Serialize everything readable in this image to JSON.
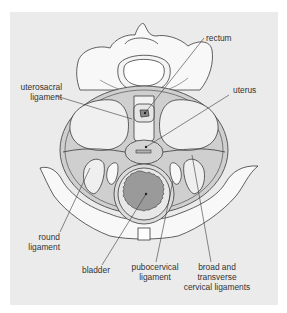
{
  "diagram": {
    "colors": {
      "background_panel": "#ebebeb",
      "bone": "#f7f7f7",
      "ligament_band": "#c9c9c9",
      "organ_fill": "#d6d6d6",
      "bladder_inner": "#9a9a9a",
      "rectum_inner": "#8a8a8a",
      "outline": "#3a3a3a"
    },
    "labels": {
      "rectum": "rectum",
      "uterosacral_1": "uterosacral",
      "uterosacral_2": "ligament",
      "uterus": "uterus",
      "round_1": "round",
      "round_2": "ligament",
      "bladder": "bladder",
      "pubocervical_1": "pubocervical",
      "pubocervical_2": "ligament",
      "broad_1": "broad and",
      "broad_2": "transverse",
      "broad_3": "cervical ligaments"
    }
  }
}
